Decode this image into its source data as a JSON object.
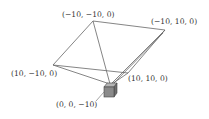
{
  "diagram": {
    "labels": {
      "top": "(−10, −10, 0)",
      "right": "(−10, 10, 0)",
      "left": "(10, −10, 0)",
      "lower_right": "(10, 10, 0)",
      "camera": "(0, 0, −10)"
    },
    "vertices": {
      "top": [
        93,
        21
      ],
      "right": [
        165,
        30
      ],
      "left": [
        53,
        65
      ],
      "lower_right": [
        113,
        80
      ],
      "apex": [
        110,
        83
      ]
    },
    "colors": {
      "line": "#666666",
      "cube_front": "#8a8a8a",
      "cube_top": "#b5b5b5",
      "cube_side": "#6e6e6e",
      "text": "#333333"
    }
  }
}
